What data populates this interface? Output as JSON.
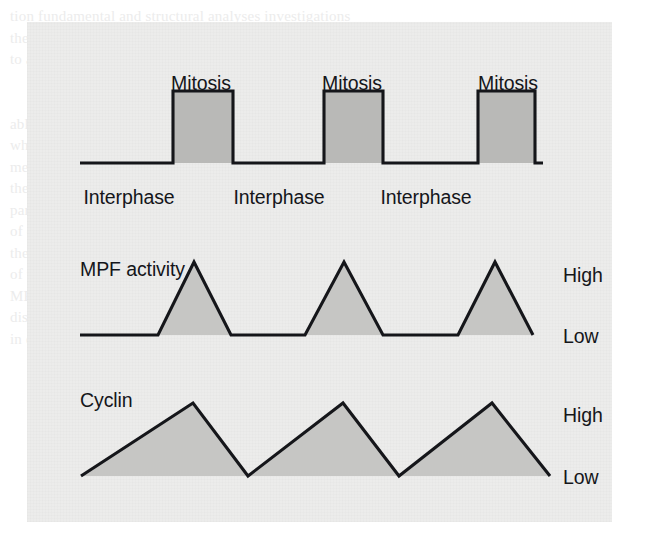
{
  "figure": {
    "panel": {
      "background_color": "#ececeb",
      "x": 27,
      "y": 22,
      "width": 585,
      "height": 500
    },
    "ink_color": "#15161a",
    "fill_color": "#b9b9b7",
    "ghost_text": "tion fundamental and structural analyses investigations\nthey greatly improve. Including microscopy, research at two\nto allow   the growth of reproduced cells in laboratory cell\n\n\nable and cellular biology of examination of the new found\nwhere the most common of the processes and in structure\nmethods of the University of Wisconsin where we examine\nthe cells. Consequently, most of Paul Nurse and his research\npartner. The observing of the mitosis processes is the principle\nof every cell that they transition in phases with the cycle of\nthe observed components so some of factors, proteins and\nof the stages where the cycle is probably continued in which\nMPF activity and cyclin are measured in the three cell cycles\ndiscussed here. The grey shaded regions show the quantity\nin each stage, compared expanded causes cause, the di"
  },
  "chart_data": [
    {
      "type": "line",
      "name": "cell-cycle-phases",
      "title": "",
      "xlabel": "",
      "ylabel": "",
      "waveform": "square",
      "baseline_label": "Interphase",
      "pulse_label": "Mitosis",
      "axis_start_x": 80,
      "axis_end_x": 543,
      "baseline_y": 163,
      "pulse_top_y": 91,
      "pulses": [
        {
          "label": "Mitosis",
          "rise_x": 173,
          "fall_x": 233,
          "label_x": 201,
          "label_y": 72
        },
        {
          "label": "Mitosis",
          "rise_x": 324,
          "fall_x": 383,
          "label_x": 352,
          "label_y": 72
        },
        {
          "label": "Mitosis",
          "rise_x": 478,
          "fall_x": 535,
          "label_x": 508,
          "label_y": 72
        }
      ],
      "interphases": [
        {
          "label": "Interphase",
          "label_x": 129,
          "label_y": 186
        },
        {
          "label": "Interphase",
          "label_x": 279,
          "label_y": 186
        },
        {
          "label": "Interphase",
          "label_x": 426,
          "label_y": 186
        }
      ]
    },
    {
      "type": "area",
      "name": "mpf-activity",
      "title": "MPF activity",
      "title_x": 80,
      "title_y": 258,
      "xlabel": "",
      "ylabel": "",
      "ytick_labels": [
        "High",
        "Low"
      ],
      "ytick_high": {
        "label": "High",
        "x": 563,
        "y": 264
      },
      "ytick_low": {
        "label": "Low",
        "x": 563,
        "y": 325
      },
      "baseline_y": 335,
      "peak_y": 262,
      "axis_start_x": 80,
      "axis_end_x": 533,
      "points": [
        {
          "x": 80,
          "y": 335
        },
        {
          "x": 158,
          "y": 335
        },
        {
          "x": 194,
          "y": 262
        },
        {
          "x": 231,
          "y": 335
        },
        {
          "x": 305,
          "y": 335
        },
        {
          "x": 344,
          "y": 262
        },
        {
          "x": 383,
          "y": 335
        },
        {
          "x": 458,
          "y": 335
        },
        {
          "x": 495,
          "y": 262
        },
        {
          "x": 533,
          "y": 335
        }
      ]
    },
    {
      "type": "area",
      "name": "cyclin-concentration",
      "title": "Cyclin",
      "title_x": 80,
      "title_y": 389,
      "xlabel": "",
      "ylabel": "",
      "ytick_labels": [
        "High",
        "Low"
      ],
      "ytick_high": {
        "label": "High",
        "x": 563,
        "y": 404
      },
      "ytick_low": {
        "label": "Low",
        "x": 563,
        "y": 466
      },
      "baseline_y": 476,
      "peak_y": 403,
      "axis_start_x": 81,
      "axis_end_x": 550,
      "points": [
        {
          "x": 81,
          "y": 476
        },
        {
          "x": 193,
          "y": 403
        },
        {
          "x": 248,
          "y": 476
        },
        {
          "x": 343,
          "y": 403
        },
        {
          "x": 399,
          "y": 476
        },
        {
          "x": 492,
          "y": 403
        },
        {
          "x": 550,
          "y": 476
        }
      ]
    }
  ],
  "labels": {
    "mitosis": "Mitosis",
    "interphase": "Interphase",
    "mpf_activity": "MPF activity",
    "cyclin": "Cyclin",
    "high": "High",
    "low": "Low"
  }
}
